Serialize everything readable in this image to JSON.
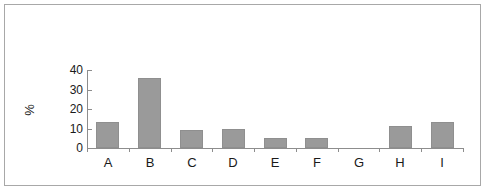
{
  "chart_data": {
    "type": "bar",
    "title": "",
    "xlabel": "",
    "ylabel": "%",
    "categories": [
      "A",
      "B",
      "C",
      "D",
      "E",
      "F",
      "G",
      "H",
      "I"
    ],
    "values": [
      13.5,
      36,
      9.3,
      9.5,
      5,
      5,
      0,
      11.5,
      13.5
    ],
    "ylim": [
      0,
      40
    ],
    "ytick_labels": [
      "40",
      "30",
      "20",
      "10",
      "0"
    ],
    "ytick_values": [
      40,
      30,
      20,
      10,
      0
    ],
    "ytick_step": 10,
    "grid": false,
    "legend": false,
    "bar_color": "#9a9a9a",
    "bar_border_color": "#8f8f8f",
    "axis_color": "#8d8d8d",
    "text_color": "#1a1a1a",
    "frame_border_color": "#a8a8a8",
    "background_color": "#ffffff"
  }
}
